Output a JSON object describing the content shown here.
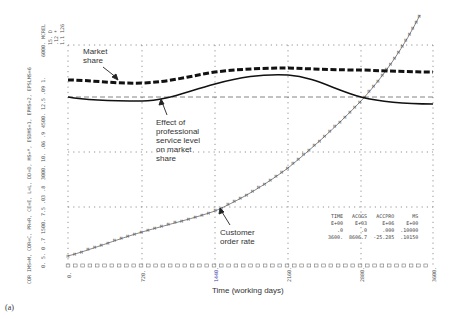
{
  "figure_label": "(a)",
  "chart_data": {
    "type": "line",
    "title": "",
    "xlabel": "Time (working days)",
    "x_ticks": [
      "0.",
      "720.",
      "1440.",
      "2160.",
      "2880.",
      "3600."
    ],
    "xlim": [
      0,
      3600
    ],
    "grid": true,
    "y_axis_header": "MCREL, D, *, 126",
    "y_axis_legend_text": "COR IMS=M, COR=C, PR=R, CE=E, L=L, DD=D, MS=*, ESDMS=1, EPMS=2, EPSLMS=6",
    "y_scales": [
      {
        "name": "Customer order rate (M)",
        "ticks": [
          "0.",
          "1500.",
          "3000.",
          "4500.",
          "6000."
        ]
      },
      {
        "name": "scale 2",
        "ticks": [
          "5.",
          "7.5",
          "10.",
          "12.5",
          "15."
        ]
      },
      {
        "name": "Market share (*)",
        "ticks": [
          "0",
          ".03",
          ".06",
          ".09",
          ".12"
        ]
      },
      {
        "name": "Effect of professional service level (1)",
        "ticks": [
          ".7",
          ".8",
          ".9",
          "1.",
          "1.1"
        ]
      }
    ],
    "series": [
      {
        "name": "Market share",
        "style": "thick-dashed",
        "x": [
          0,
          360,
          720,
          1080,
          1440,
          1800,
          2160,
          2520,
          2880,
          3240,
          3600
        ],
        "values": [
          0.1025,
          0.101,
          0.099,
          0.101,
          0.1065,
          0.11,
          0.1105,
          0.11,
          0.108,
          0.106,
          0.1015
        ]
      },
      {
        "name": "Effect of professional service level on market share",
        "style": "solid",
        "x": [
          0,
          360,
          720,
          1080,
          1440,
          1800,
          2160,
          2520,
          2880,
          3240,
          3600
        ],
        "values": [
          1.0,
          0.99,
          0.99,
          1.01,
          1.04,
          1.06,
          1.06,
          1.04,
          1.01,
          0.99,
          0.985
        ]
      },
      {
        "name": "Customer order rate",
        "style": "thin-with-markers",
        "x": [
          0,
          360,
          720,
          1080,
          1440,
          1800,
          2160,
          2520,
          2880,
          3240,
          3450
        ],
        "values": [
          210,
          380,
          620,
          950,
          1380,
          2000,
          2700,
          3600,
          4500,
          5500,
          6000
        ]
      }
    ],
    "annotations": [
      {
        "text": "Market share",
        "target": "Market share"
      },
      {
        "text": "Effect of professional service level on market share",
        "target": "Effect of professional service level on market share"
      },
      {
        "text": "Customer order rate",
        "target": "Customer order rate"
      }
    ],
    "table": {
      "headers": [
        "TIME",
        "ACOGS",
        "ACCPRO",
        "MS"
      ],
      "units": [
        "E+00",
        "E+03",
        "E+06",
        "E+00"
      ],
      "rows": [
        [
          ".0",
          ".0",
          ".000",
          ".10000"
        ],
        [
          "3600.",
          "8606.7",
          "-25.285",
          ".10150"
        ]
      ]
    }
  },
  "labels": {
    "market_share": "Market\nshare",
    "effect": "Effect of\nprofessional\nservice level\non market\nshare",
    "order_rate": "Customer\norder rate",
    "xlabel": "Time (working days)",
    "y_header_1": "6000.   MCREL",
    "y_header_2": "15.   D",
    "y_header_3": ".12   *",
    "y_header_4": "1.1   126",
    "y_t4500": "4500.  12.5  .09  1.",
    "y_t3000": "3000.  10.  .06  .9",
    "y_t1500": "1500.  7.5  .03  .8",
    "y_t0": "0.  5.  0  .7",
    "y_legend": "COR IMS=M, COR=C, PR=R, CE=E, L=L, DD=D, MS=*, ESDMS=1, EPMS=2, EPSLMS=6",
    "x0": "0.",
    "x1": "720.",
    "x2": "1440.",
    "x3": "2160.",
    "x4": "2880.",
    "x5": "3600."
  }
}
